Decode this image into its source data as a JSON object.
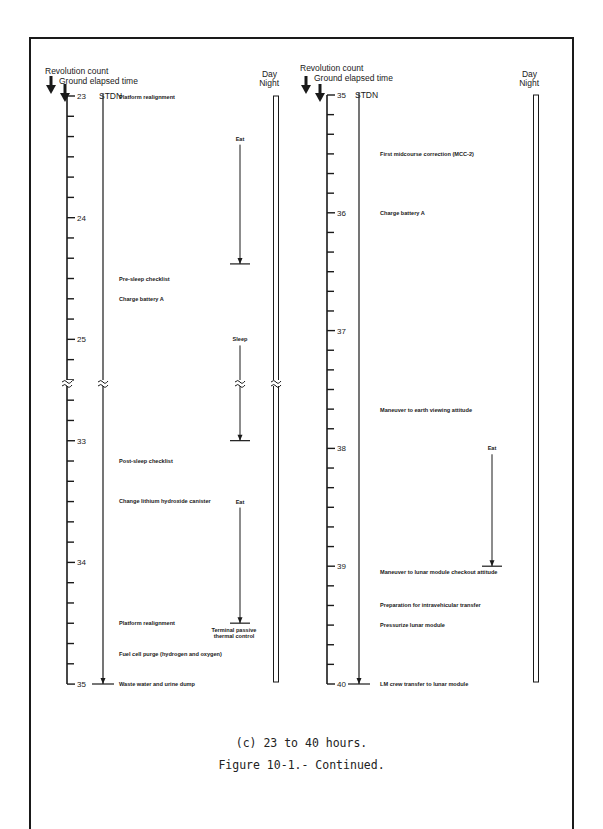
{
  "figure": {
    "subcaption": "(c) 23 to 40 hours.",
    "caption": "Figure 10-1.- Continued."
  },
  "colors": {
    "ink": "#1a1a1a",
    "paper": "#ffffff"
  },
  "panels": [
    {
      "id": "left",
      "header_revolution": "Revolution count",
      "header_get": "Ground elapsed time",
      "station": "STDN",
      "daynight_day": "Day",
      "daynight_night": "Night",
      "segments": [
        {
          "start_hour": 23,
          "end_hour": 25.333,
          "tick_labels": [
            "23",
            "24",
            "25"
          ]
        },
        {
          "start_hour": 32.667,
          "end_hour": 35,
          "tick_labels": [
            "33",
            "34",
            "35"
          ]
        }
      ],
      "hour_labels": [
        {
          "hour": 23,
          "label": "23"
        },
        {
          "hour": 24,
          "label": "24"
        },
        {
          "hour": 25,
          "label": "25"
        },
        {
          "hour": 33,
          "label": "33"
        },
        {
          "hour": 34,
          "label": "34"
        },
        {
          "hour": 35,
          "label": "35"
        }
      ],
      "events": [
        {
          "hour": 23.0,
          "text": "Platform realignment"
        },
        {
          "hour": 24.5,
          "text": "Pre-sleep checklist"
        },
        {
          "hour": 24.67,
          "text": "Charge battery A"
        },
        {
          "hour": 33.17,
          "text": "Post-sleep checklist"
        },
        {
          "hour": 33.5,
          "text": "Change lithium hydroxide canister"
        },
        {
          "hour": 34.5,
          "text": "Platform realignment"
        },
        {
          "hour": 34.75,
          "text": "Fuel cell purge (hydrogen and oxygen)"
        },
        {
          "hour": 35.0,
          "text": "Waste water and urine dump"
        }
      ],
      "activities": [
        {
          "label": "Eat",
          "start_hour": 23.4,
          "end_hour": 24.38,
          "note": ""
        },
        {
          "label": "Sleep",
          "start_hour": 25.05,
          "end_hour": 33.0,
          "note": ""
        },
        {
          "label": "Eat",
          "start_hour": 33.55,
          "end_hour": 34.5,
          "note": "Terminal passive thermal control"
        }
      ]
    },
    {
      "id": "right",
      "header_revolution": "Revolution count",
      "header_get": "Ground elapsed time",
      "station": "STDN",
      "daynight_day": "Day",
      "daynight_night": "Night",
      "segments": [
        {
          "start_hour": 35,
          "end_hour": 40,
          "tick_labels": [
            "35",
            "36",
            "37",
            "38",
            "39",
            "40"
          ]
        }
      ],
      "hour_labels": [
        {
          "hour": 35,
          "label": "35"
        },
        {
          "hour": 36,
          "label": "36"
        },
        {
          "hour": 37,
          "label": "37"
        },
        {
          "hour": 38,
          "label": "38"
        },
        {
          "hour": 39,
          "label": "39"
        },
        {
          "hour": 40,
          "label": "40"
        }
      ],
      "events": [
        {
          "hour": 35.5,
          "text": "First midcourse correction (MCC-2)"
        },
        {
          "hour": 36.0,
          "text": "Charge battery A"
        },
        {
          "hour": 37.67,
          "text": "Maneuver to earth viewing attitude"
        },
        {
          "hour": 39.05,
          "text": "Maneuver to lunar module checkout attitude"
        },
        {
          "hour": 39.33,
          "text": "Preparation for intravehicular transfer"
        },
        {
          "hour": 39.5,
          "text": "Pressurize lunar module"
        },
        {
          "hour": 40.0,
          "text": "LM crew transfer to lunar module"
        }
      ],
      "activities": [
        {
          "label": "Eat",
          "start_hour": 38.05,
          "end_hour": 39.0,
          "note": ""
        }
      ]
    }
  ]
}
